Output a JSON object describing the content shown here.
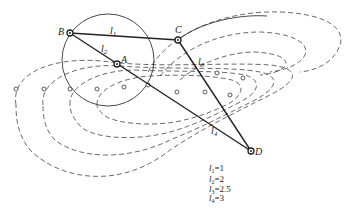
{
  "diagram": {
    "type": "four-bar linkage with coupler curves",
    "joints": [
      {
        "id": "B",
        "label": "B",
        "x": 70,
        "y": 33
      },
      {
        "id": "C",
        "label": "C",
        "x": 178,
        "y": 40
      },
      {
        "id": "A",
        "label": "A",
        "x": 117,
        "y": 64
      },
      {
        "id": "D",
        "label": "D",
        "x": 251,
        "y": 151
      }
    ],
    "links": [
      {
        "id": "l1",
        "label": "l1",
        "from": "B",
        "to": "C"
      },
      {
        "id": "l2",
        "label": "l2",
        "from": "B",
        "to": "A"
      },
      {
        "id": "l3",
        "label": "l3",
        "from": "C",
        "to": "D"
      },
      {
        "id": "l4",
        "label": "l4",
        "from": "A",
        "to": "D"
      }
    ],
    "labels": {
      "B": "B",
      "C": "C",
      "A": "A",
      "D": "D",
      "l1": "l",
      "l2": "l",
      "l3": "l",
      "l4": "l",
      "l1_sub": "1",
      "l2_sub": "2",
      "l3_sub": "3",
      "l4_sub": "4"
    },
    "legend": [
      {
        "name": "l",
        "sub": "1",
        "value": "=1"
      },
      {
        "name": "l",
        "sub": "2",
        "value": "=2"
      },
      {
        "name": "l",
        "sub": "3",
        "value": "=2.5"
      },
      {
        "name": "l",
        "sub": "4",
        "value": "=3"
      }
    ],
    "colors": {
      "line": "#222222",
      "background": "#ffffff"
    }
  }
}
